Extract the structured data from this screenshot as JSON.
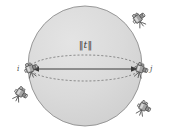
{
  "figure": {
    "name": "sphere-baseline-diagram",
    "background_color": "#ffffff",
    "width": 171,
    "height": 133
  },
  "sphere": {
    "name": "uncertainty-sphere",
    "center_x": 85,
    "center_y": 66,
    "radius_x": 57,
    "radius_y": 60,
    "fill_color": "#d9d9d9",
    "stroke_color": "#8c8c8c"
  },
  "great_circle": {
    "name": "equator-dashed-ellipse",
    "center_x": 85,
    "center_y": 68,
    "radius_x": 55,
    "radius_y": 13,
    "stroke_color": "#6e6e6e",
    "dash": "2,2"
  },
  "baseline": {
    "name": "baseline-vector",
    "from_x": 30,
    "from_y": 69,
    "to_x": 140,
    "to_y": 69,
    "stroke_color": "#3a3a3a",
    "label": "||t||",
    "label_full": "||t_ij||"
  },
  "labels": {
    "norm": "‖t‖",
    "node_i": "i",
    "node_j": "j"
  },
  "cameras": [
    {
      "id": "camera-node-i",
      "name": "camera-icon-node-i",
      "x": 30,
      "y": 69,
      "rotation": -20,
      "scale": 1.0,
      "on_baseline": true
    },
    {
      "id": "camera-node-j",
      "name": "camera-icon-node-j",
      "x": 140,
      "y": 69,
      "rotation": 15,
      "scale": 1.0,
      "on_baseline": true
    },
    {
      "id": "camera-top-right",
      "name": "camera-icon-top-right",
      "x": 138,
      "y": 19,
      "rotation": -35,
      "scale": 1.0,
      "on_baseline": false
    },
    {
      "id": "camera-bottom-left",
      "name": "camera-icon-bottom-left",
      "x": 20,
      "y": 93,
      "rotation": 30,
      "scale": 1.0,
      "on_baseline": false
    },
    {
      "id": "camera-bottom-right",
      "name": "camera-icon-bottom-right",
      "x": 143,
      "y": 107,
      "rotation": 25,
      "scale": 1.0,
      "on_baseline": false
    }
  ],
  "style": {
    "camera_body_color": "#9a9a9a",
    "camera_outline_color": "#4a4a4a",
    "camera_highlight_color": "#e2e2e2",
    "text_color": "#3c3c3c"
  }
}
